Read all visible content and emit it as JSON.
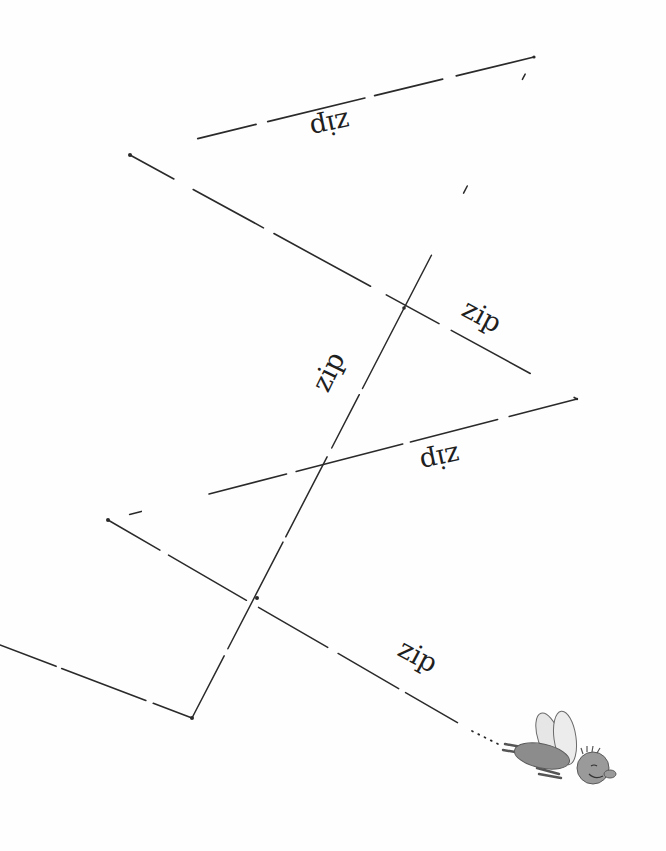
{
  "illustration": {
    "description": "Hand-drawn zig-zag flight path of a fly with repeated 'zip' labels",
    "line_color": "#2a2a2a",
    "background": "#fefefe",
    "path_points": [
      [
        0,
        645
      ],
      [
        192,
        718
      ],
      [
        534,
        57
      ],
      [
        130,
        155
      ],
      [
        577,
        399
      ],
      [
        108,
        520
      ],
      [
        500,
        745
      ]
    ],
    "labels": [
      {
        "text": "zip",
        "x": 340,
        "y": 128,
        "rotate": 168
      },
      {
        "text": "zip",
        "x": 490,
        "y": 318,
        "rotate": 28
      },
      {
        "text": "zip",
        "x": 338,
        "y": 372,
        "rotate": -64
      },
      {
        "text": "zip",
        "x": 450,
        "y": 460,
        "rotate": 168
      },
      {
        "text": "zip",
        "x": 426,
        "y": 658,
        "rotate": 28
      }
    ],
    "fly": {
      "icon": "fly-icon",
      "x": 497,
      "y": 708
    }
  }
}
